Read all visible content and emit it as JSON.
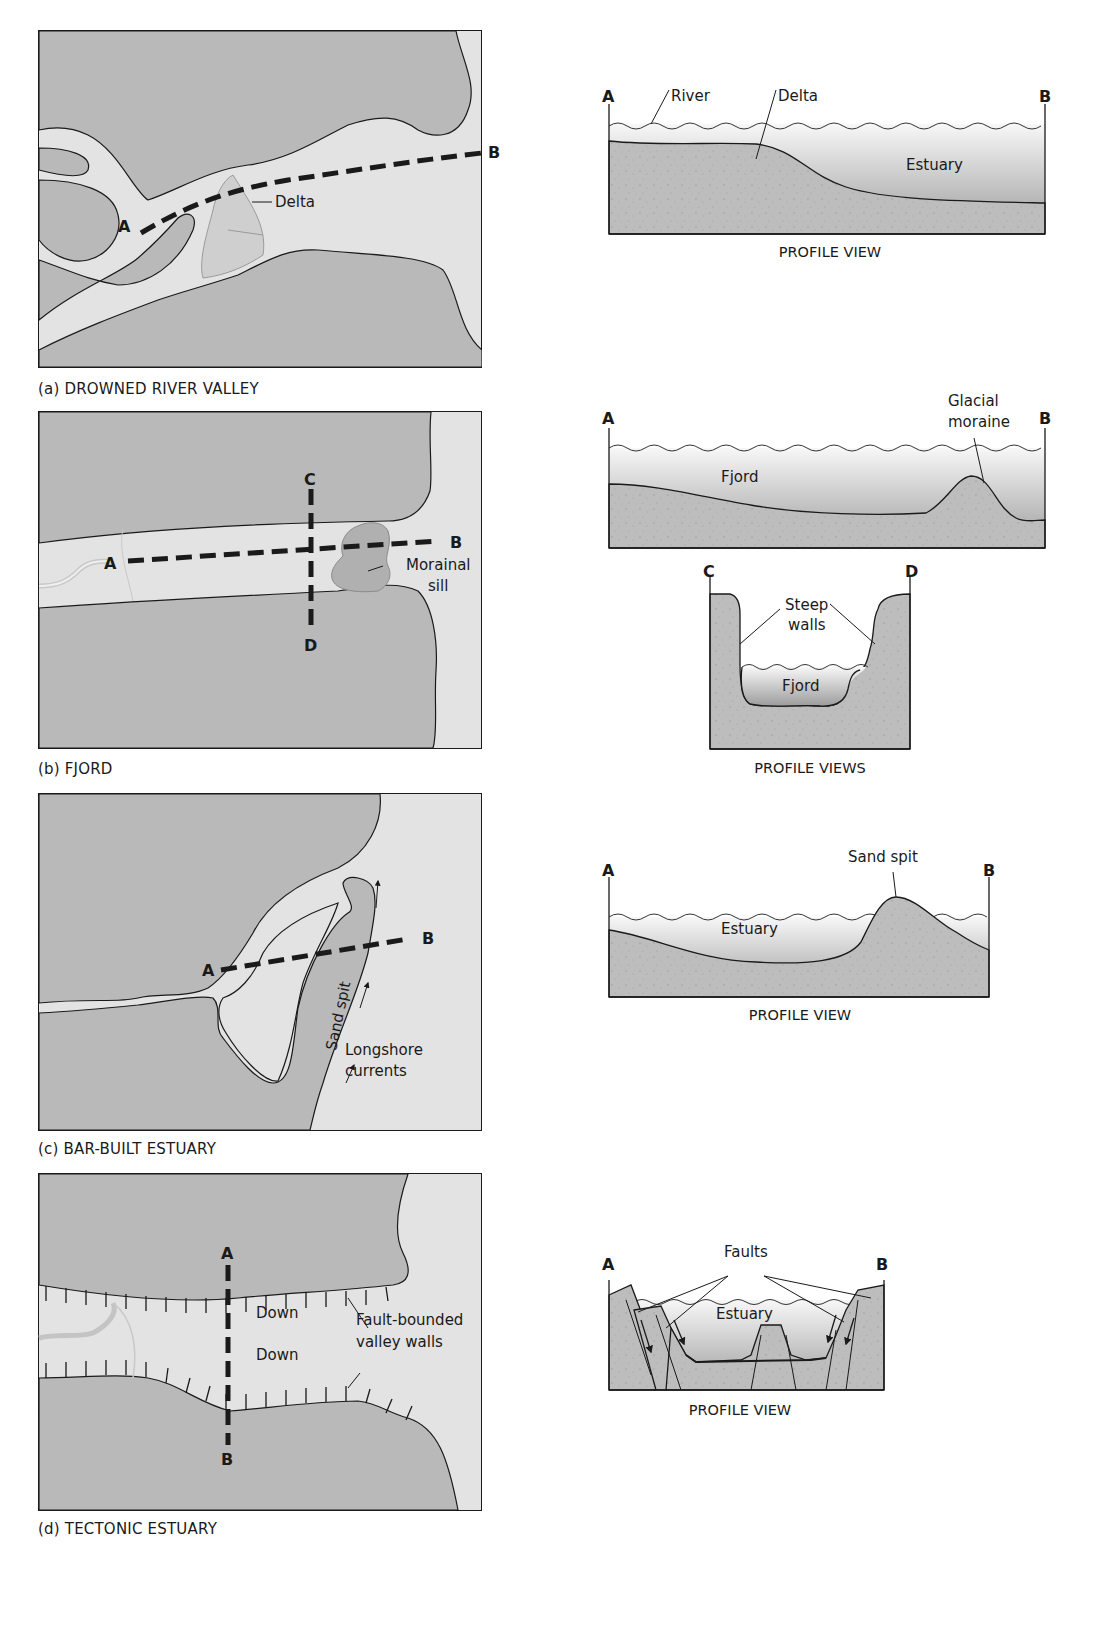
{
  "colors": {
    "land": "#b9b9b9",
    "water": "#e3e3e3",
    "sediment": "#bfbfbf",
    "outline": "#1a1a1a",
    "background": "#ffffff"
  },
  "panels": [
    {
      "id": "a",
      "caption": "(a) DROWNED RIVER VALLEY",
      "map": {
        "labels": {
          "point_a": "A",
          "point_b": "B",
          "delta": "Delta"
        }
      },
      "profile": {
        "caption": "PROFILE VIEW",
        "labels": {
          "point_a": "A",
          "point_b": "B",
          "river": "River",
          "delta": "Delta",
          "estuary": "Estuary"
        }
      }
    },
    {
      "id": "b",
      "caption": "(b) FJORD",
      "map": {
        "labels": {
          "point_a": "A",
          "point_b": "B",
          "point_c": "C",
          "point_d": "D",
          "morainal_sill_1": "Morainal",
          "morainal_sill_2": "sill"
        }
      },
      "profile": {
        "caption": "PROFILE VIEWS",
        "labels": {
          "point_a": "A",
          "point_b": "B",
          "fjord": "Fjord",
          "glacial_moraine_1": "Glacial",
          "glacial_moraine_2": "moraine"
        },
        "cross_section": {
          "labels": {
            "point_c": "C",
            "point_d": "D",
            "steep_walls_1": "Steep",
            "steep_walls_2": "walls",
            "fjord": "Fjord"
          }
        }
      }
    },
    {
      "id": "c",
      "caption": "(c) BAR-BUILT ESTUARY",
      "map": {
        "labels": {
          "point_a": "A",
          "point_b": "B",
          "sand_spit": "Sand spit",
          "longshore_1": "Longshore",
          "longshore_2": "currents"
        }
      },
      "profile": {
        "caption": "PROFILE VIEW",
        "labels": {
          "point_a": "A",
          "point_b": "B",
          "estuary": "Estuary",
          "sand_spit": "Sand spit"
        }
      }
    },
    {
      "id": "d",
      "caption": "(d) TECTONIC ESTUARY",
      "map": {
        "labels": {
          "point_a": "A",
          "point_b": "B",
          "down_1": "Down",
          "down_2": "Down",
          "fault_walls_1": "Fault-bounded",
          "fault_walls_2": "valley walls"
        }
      },
      "profile": {
        "caption": "PROFILE VIEW",
        "labels": {
          "point_a": "A",
          "point_b": "B",
          "faults": "Faults",
          "estuary": "Estuary"
        }
      }
    }
  ]
}
